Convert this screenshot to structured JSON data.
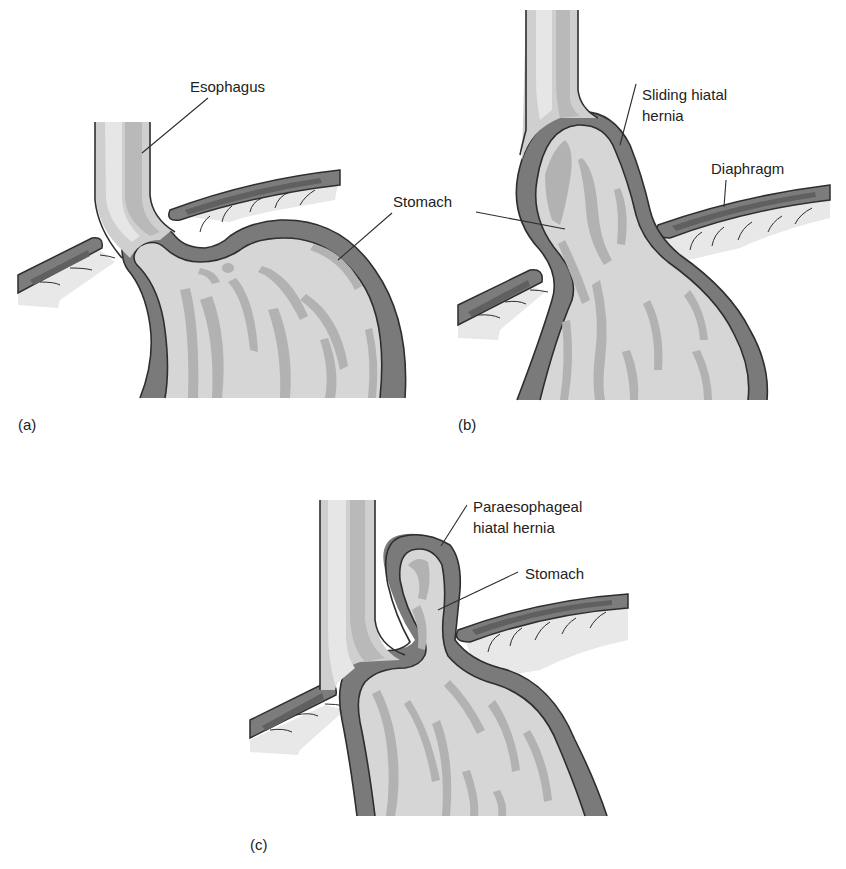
{
  "figure": {
    "panels": [
      {
        "id": "a",
        "panel_label": "(a)",
        "labels": {
          "esophagus": "Esophagus",
          "stomach": "Stomach"
        }
      },
      {
        "id": "b",
        "panel_label": "(b)",
        "labels": {
          "hernia_line1": "Sliding hiatal",
          "hernia_line2": "hernia",
          "diaphragm": "Diaphragm"
        }
      },
      {
        "id": "c",
        "panel_label": "(c)",
        "labels": {
          "hernia_line1": "Paraesophageal",
          "hernia_line2": "hiatal hernia",
          "stomach": "Stomach"
        }
      }
    ]
  },
  "colors": {
    "outline": "#2e2e2e",
    "stomach_wall": "#7a7a7a",
    "stomach_fill": "#d6d6d6",
    "rugal_folds": "#b2b2b2",
    "esophagus_highlight": "#e6e6e6",
    "diaphragm": "#7c7c7c"
  }
}
